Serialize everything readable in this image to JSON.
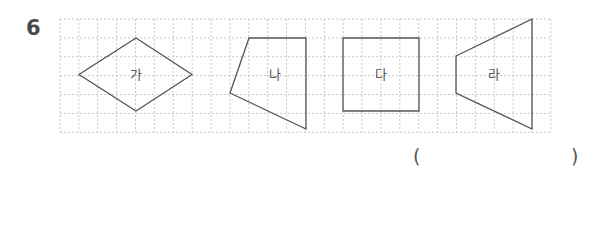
{
  "problem": {
    "number": "6"
  },
  "grid": {
    "left": 60,
    "top": 19,
    "cell": 18.88,
    "cols": 26,
    "rows": 6,
    "line_color": "#c8c8c8"
  },
  "shapes": [
    {
      "id": "ga",
      "label": "가",
      "type": "rhombus",
      "points": "136,38 192,74.5 136,111 79,74.5",
      "label_pos": [
        136,
        79
      ]
    },
    {
      "id": "na",
      "label": "나",
      "type": "quadrilateral",
      "points": "249,38 306,38 306,129 230,93",
      "label_pos": [
        275,
        79
      ]
    },
    {
      "id": "da",
      "label": "다",
      "type": "square",
      "points": "343,38 419,38 419,111 343,111",
      "label_pos": [
        381,
        79
      ]
    },
    {
      "id": "ra",
      "label": "라",
      "type": "trapezoid",
      "points": "456,56 532,19 532,129 456,93",
      "label_pos": [
        494,
        79
      ]
    }
  ],
  "stroke_color": "#555555",
  "answer": {
    "open_paren": "(",
    "close_paren": ")",
    "value": ""
  }
}
